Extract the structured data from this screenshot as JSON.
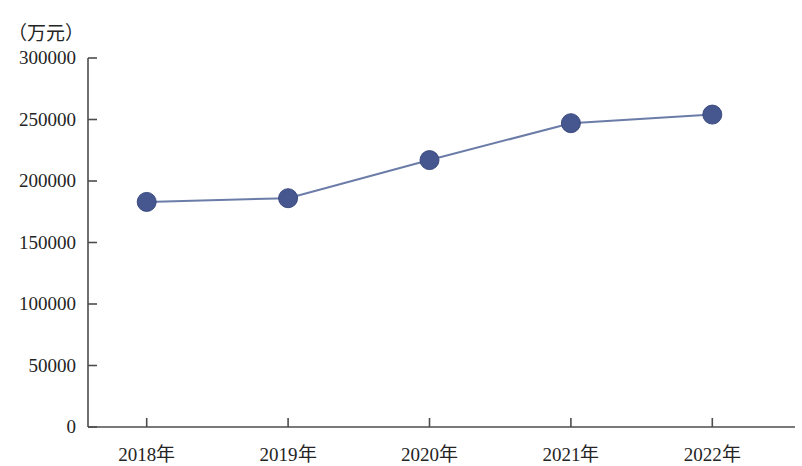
{
  "chart_data": {
    "type": "line",
    "title": "",
    "subtitle": "",
    "xlabel": "",
    "ylabel": "",
    "unit_label": "（万元）",
    "categories": [
      "2018年",
      "2019年",
      "2020年",
      "2021年",
      "2022年"
    ],
    "values": [
      183000,
      186000,
      217000,
      247000,
      254000
    ],
    "series": [
      {
        "name": "",
        "values": [
          183000,
          186000,
          217000,
          247000,
          254000
        ]
      }
    ],
    "ylim": [
      0,
      300000
    ],
    "yticks": [
      0,
      50000,
      100000,
      150000,
      200000,
      250000,
      300000
    ],
    "ytick_labels": [
      "0",
      "50000",
      "100000",
      "150000",
      "200000",
      "250000",
      "300000"
    ],
    "xtick_labels": [
      "2018年",
      "2019年",
      "2020年",
      "2021年",
      "2022年"
    ],
    "grid": false,
    "legend": "none",
    "colors": {
      "line": "#6b7ca8",
      "marker_fill": "#46578f",
      "marker_edge": "#3b4b80",
      "axis": "#4d4d4d",
      "text": "#242424",
      "background": "#ffffff"
    }
  }
}
